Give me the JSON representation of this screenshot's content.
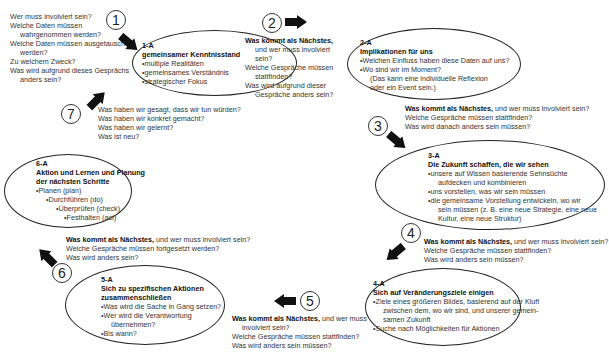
{
  "steps": [
    {
      "number": "1",
      "questions": [
        "Wer muss involviert sein?",
        "Welche Daten müssen",
        "wahrgenommen werden?",
        "Welche Daten müssen ausgetauscht",
        "werden?",
        "Zu welchem Zweck?",
        "Was wird aufgrund dieses Gesprächs",
        "anders sein?"
      ]
    },
    {
      "number": "2",
      "lead": "Was kommt als Nächstes,",
      "questions": [
        "und wer muss involviert",
        "sein?",
        "Welche Gespräche müssen",
        "stattfinden?",
        "Was wird aufgrund dieser",
        "Gespräche anders sein?"
      ]
    },
    {
      "number": "3",
      "lead": "Was kommt als Nächstes,",
      "lead_rest": " und wer muss involviert sein?",
      "questions": [
        "Welche Gespräche müssen stattfinden?",
        "Was wird danach anders sein müssen?"
      ]
    },
    {
      "number": "4",
      "lead": "Was kommt als Nächstes,",
      "lead_rest": " und wer muss involviert sein?",
      "questions": [
        "Welche Gespräche müssen stattfinden?",
        "Was wird anders sein müssen?"
      ]
    },
    {
      "number": "5",
      "lead": "Was kommt als Nächstes,",
      "lead_rest": " und wer muss",
      "questions": [
        "involviert sein?",
        "Welche Gespräche müssen stattfinden?",
        "Was wird anders sein müssen?"
      ]
    },
    {
      "number": "6",
      "lead": "Was kommt als Nächstes,",
      "lead_rest": " und wer muss involviert sein?",
      "questions": [
        "Welche Gespräche müssen fortgesetzt werden?",
        "Was wird anders sein?"
      ]
    },
    {
      "number": "7",
      "questions": [
        "Was haben wir gesagt, dass wir tun würden?",
        "Was haben wir konkret gemacht?",
        "Was haben wir gelernt?",
        "Was ist neu?"
      ]
    }
  ],
  "phases": [
    {
      "id": "1-A",
      "title": "gemeinsamer Kenntnisstand",
      "bullets": [
        "multiple Realitäten",
        "gemeinsames Verständnis",
        "strategischer Fokus"
      ]
    },
    {
      "id": "2-A",
      "title": "Implikationen für uns",
      "bullets": [
        "Welchen Einfluss haben diese Daten auf uns?",
        "Wo sind wir im Moment?"
      ],
      "note": [
        "(Das kann eine individuelle Reflexion",
        "oder ein Event sein.)"
      ]
    },
    {
      "id": "3-A",
      "title": "Die Zukunft schaffen, die wir sehen",
      "bullets": [
        "unsere auf Wissen basierende Sehnsüchte",
        "aufdecken und kombinieren",
        "uns vorstellen, was wir sein müssen",
        "die gemeinsame Vorstellung entwickeln, wo wir",
        "sein müssen (z. B. eine neue Strategie, eine neue",
        "Kultur, eine neue Struktur)"
      ]
    },
    {
      "id": "4-A",
      "title": "Sich auf Veränderungsziele einigen",
      "bullets": [
        "Ziele eines größeren Bildes, basierend auf der Kluft",
        "zwischen dem, wo wir sind, und unserer gemein-",
        "samen Zukunft",
        "Suche nach Möglichkeiten für Aktionen"
      ]
    },
    {
      "id": "5-A",
      "title_lines": [
        "Sich zu spezifischen Aktionen",
        "zusammenschließen"
      ],
      "bullets": [
        "Was wird die Sache in Gang setzen?",
        "Wer wird die Verantwortung",
        "übernehmen?",
        "Bis wann?"
      ]
    },
    {
      "id": "6-A",
      "title_lines": [
        "Aktion und Lernen und Planung",
        "der nächsten Schritte"
      ],
      "bullets": [
        "Planen (plan)",
        "Durchführen (do)",
        "Überprüfen (check)",
        "Festhalten (act)"
      ]
    }
  ],
  "colors": {
    "ink": "#222222",
    "text": "#333333",
    "background": "#ffffff"
  }
}
